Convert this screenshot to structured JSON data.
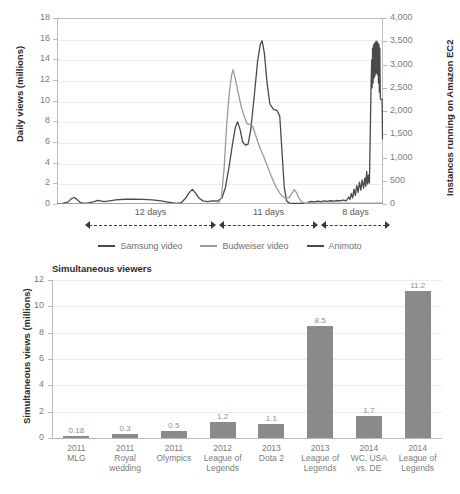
{
  "chart_data": [
    {
      "type": "line",
      "title": "",
      "xlabel": "",
      "ylabel": "Daily views (millions)",
      "y2label": "Instances running on Amazon EC2",
      "ylim": [
        0,
        18
      ],
      "y2lim": [
        0,
        4000
      ],
      "yticks": [
        "18",
        "16",
        "14",
        "12",
        "10",
        "8",
        "6",
        "4",
        "2",
        "0"
      ],
      "y2ticks": [
        "4,000",
        "3,500",
        "3,000",
        "2,500",
        "2,000",
        "1,500",
        "1,000",
        "500",
        "0"
      ],
      "grid": true,
      "legend_position": "bottom",
      "legend": [
        {
          "name": "Samsung video",
          "color": "#4a4a4a"
        },
        {
          "name": "Budweiser video",
          "color": "#9a9a9a"
        },
        {
          "name": "Animoto",
          "color": "#4a4a4a"
        }
      ],
      "annotations": [
        {
          "label": "12 days",
          "x_start": 85,
          "x_end": 216
        },
        {
          "label": "11 days",
          "x_start": 219,
          "x_end": 318
        },
        {
          "label": "8 days",
          "x_start": 321,
          "x_end": 390
        }
      ],
      "series": [
        {
          "name": "Samsung video",
          "color": "#4a4a4a",
          "axis": "left",
          "points": [
            [
              0.0,
              0.02
            ],
            [
              1.2,
              0.05
            ],
            [
              2.4,
              0.18
            ],
            [
              3.2,
              0.52
            ],
            [
              3.8,
              0.63
            ],
            [
              4.4,
              0.45
            ],
            [
              5.2,
              0.12
            ],
            [
              6.0,
              0.06
            ],
            [
              7.0,
              0.1
            ],
            [
              8.2,
              0.22
            ],
            [
              9.0,
              0.35
            ],
            [
              9.6,
              0.3
            ],
            [
              10.4,
              0.22
            ],
            [
              11.6,
              0.3
            ],
            [
              13.0,
              0.4
            ],
            [
              15.0,
              0.46
            ],
            [
              17.0,
              0.47
            ],
            [
              19.0,
              0.45
            ],
            [
              21.0,
              0.4
            ],
            [
              23.0,
              0.3
            ],
            [
              24.5,
              0.18
            ],
            [
              25.6,
              0.1
            ],
            [
              26.4,
              0.06
            ],
            [
              27.4,
              0.12
            ],
            [
              28.4,
              0.55
            ],
            [
              29.2,
              1.1
            ],
            [
              29.9,
              1.42
            ],
            [
              30.6,
              1.05
            ],
            [
              31.4,
              0.55
            ],
            [
              32.2,
              0.3
            ],
            [
              33.2,
              0.22
            ],
            [
              34.4,
              0.3
            ],
            [
              35.4,
              0.28
            ],
            [
              36.4,
              0.55
            ],
            [
              37.2,
              1.6
            ],
            [
              38.0,
              3.6
            ],
            [
              38.8,
              5.9
            ],
            [
              39.4,
              7.45
            ],
            [
              39.9,
              7.95
            ],
            [
              40.5,
              7.1
            ],
            [
              41.0,
              6.0
            ],
            [
              41.6,
              5.7
            ],
            [
              42.2,
              5.8
            ],
            [
              42.8,
              7.2
            ],
            [
              43.6,
              10.6
            ],
            [
              44.3,
              13.8
            ],
            [
              44.9,
              15.45
            ],
            [
              45.3,
              15.8
            ],
            [
              45.8,
              14.6
            ],
            [
              46.4,
              11.7
            ],
            [
              47.0,
              9.7
            ],
            [
              47.8,
              9.15
            ],
            [
              48.6,
              9.05
            ],
            [
              49.2,
              8.5
            ],
            [
              49.7,
              5.0
            ],
            [
              50.2,
              1.6
            ],
            [
              50.7,
              0.3
            ],
            [
              51.4,
              0.08
            ],
            [
              52.4,
              0.05
            ],
            [
              54.0,
              0.05
            ],
            [
              56.0,
              0.05
            ],
            [
              58.0,
              0.05
            ],
            [
              60.0,
              0.05
            ],
            [
              62.0,
              0.05
            ],
            [
              64.0,
              0.05
            ],
            [
              66.0,
              0.05
            ],
            [
              68.0,
              0.05
            ],
            [
              70.0,
              0.05
            ],
            [
              72.0,
              0.05
            ]
          ]
        },
        {
          "name": "Budweiser video",
          "color": "#9a9a9a",
          "axis": "left",
          "points": [
            [
              0.0,
              0.02
            ],
            [
              8.0,
              0.02
            ],
            [
              16.0,
              0.02
            ],
            [
              24.0,
              0.02
            ],
            [
              30.0,
              0.02
            ],
            [
              34.0,
              0.03
            ],
            [
              35.6,
              0.05
            ],
            [
              36.3,
              0.6
            ],
            [
              36.9,
              3.4
            ],
            [
              37.5,
              7.8
            ],
            [
              38.1,
              11.0
            ],
            [
              38.6,
              12.55
            ],
            [
              38.9,
              13.0
            ],
            [
              39.4,
              12.1
            ],
            [
              40.0,
              10.8
            ],
            [
              40.7,
              9.4
            ],
            [
              41.4,
              8.45
            ],
            [
              42.0,
              7.75
            ],
            [
              42.6,
              7.7
            ],
            [
              43.2,
              7.55
            ],
            [
              43.8,
              6.75
            ],
            [
              44.4,
              5.95
            ],
            [
              45.0,
              5.25
            ],
            [
              45.7,
              4.55
            ],
            [
              46.4,
              3.75
            ],
            [
              47.1,
              2.95
            ],
            [
              47.8,
              2.2
            ],
            [
              48.5,
              1.55
            ],
            [
              49.2,
              1.05
            ],
            [
              49.9,
              0.7
            ],
            [
              50.6,
              0.55
            ],
            [
              51.3,
              0.65
            ],
            [
              51.9,
              1.05
            ],
            [
              52.4,
              1.4
            ],
            [
              52.9,
              1.1
            ],
            [
              53.4,
              0.6
            ],
            [
              54.0,
              0.22
            ],
            [
              54.7,
              0.08
            ],
            [
              55.5,
              0.05
            ],
            [
              57.0,
              0.04
            ],
            [
              60.0,
              0.04
            ],
            [
              64.0,
              0.04
            ],
            [
              68.0,
              0.04
            ],
            [
              72.0,
              0.04
            ]
          ]
        },
        {
          "name": "Animoto",
          "color": "#4a4a4a",
          "axis": "right",
          "points": [
            [
              55.5,
              40
            ],
            [
              56.2,
              55
            ],
            [
              56.9,
              45
            ],
            [
              57.6,
              60
            ],
            [
              58.3,
              50
            ],
            [
              59.0,
              65
            ],
            [
              59.7,
              55
            ],
            [
              60.4,
              70
            ],
            [
              61.1,
              60
            ],
            [
              61.8,
              75
            ],
            [
              62.5,
              65
            ],
            [
              63.2,
              85
            ],
            [
              63.9,
              70
            ],
            [
              64.4,
              150
            ],
            [
              64.7,
              95
            ],
            [
              65.0,
              230
            ],
            [
              65.3,
              130
            ],
            [
              65.6,
              320
            ],
            [
              65.9,
              180
            ],
            [
              66.2,
              400
            ],
            [
              66.5,
              250
            ],
            [
              66.8,
              470
            ],
            [
              67.1,
              300
            ],
            [
              67.4,
              520
            ],
            [
              67.7,
              340
            ],
            [
              68.0,
              560
            ],
            [
              68.2,
              380
            ],
            [
              68.4,
              700
            ],
            [
              68.6,
              430
            ],
            [
              68.8,
              620
            ],
            [
              69.0,
              450
            ],
            [
              69.2,
              1600
            ],
            [
              69.35,
              2450
            ],
            [
              69.5,
              3100
            ],
            [
              69.6,
              2500
            ],
            [
              69.7,
              3350
            ],
            [
              69.8,
              2600
            ],
            [
              69.9,
              3420
            ],
            [
              70.0,
              2700
            ],
            [
              70.1,
              3450
            ],
            [
              70.2,
              2750
            ],
            [
              70.3,
              3480
            ],
            [
              70.4,
              2800
            ],
            [
              70.5,
              3500
            ],
            [
              70.6,
              2820
            ],
            [
              70.7,
              3490
            ],
            [
              70.8,
              2780
            ],
            [
              70.9,
              3460
            ],
            [
              71.0,
              2600
            ],
            [
              71.1,
              3430
            ],
            [
              71.2,
              2400
            ],
            [
              71.3,
              3350
            ],
            [
              71.4,
              2300
            ],
            [
              71.5,
              2250
            ],
            [
              71.6,
              2250
            ],
            [
              71.7,
              2250
            ],
            [
              71.8,
              2250
            ],
            [
              71.9,
              1400
            ]
          ]
        }
      ]
    },
    {
      "type": "bar",
      "title": "Simultaneous viewers",
      "xlabel": "",
      "ylabel": "Simultaneous views (millions)",
      "ylim": [
        0,
        12
      ],
      "yticks": [
        "12",
        "10",
        "8",
        "6",
        "4",
        "2",
        "0"
      ],
      "grid": true,
      "bar_color": "#8a8a8a",
      "categories": [
        "2011\nMLG",
        "2011\nRoyal\nwedding",
        "2011\nOlympics",
        "2012\nLeague of\nLegends",
        "2013\nDota 2",
        "2013\nLeague of\nLegends",
        "2014\nWC, USA\nvs. DE",
        "2014\nLeague of\nLegends"
      ],
      "category_lines": [
        [
          "2011",
          "MLG"
        ],
        [
          "2011",
          "Royal",
          "wedding"
        ],
        [
          "2011",
          "Olympics"
        ],
        [
          "2012",
          "League of",
          "Legends"
        ],
        [
          "2013",
          "Dota 2"
        ],
        [
          "2013",
          "League of",
          "Legends"
        ],
        [
          "2014",
          "WC, USA",
          "vs. DE"
        ],
        [
          "2014",
          "League of",
          "Legends"
        ]
      ],
      "values": [
        0.18,
        0.3,
        0.5,
        1.2,
        1.1,
        8.5,
        1.7,
        11.2
      ],
      "value_labels": [
        "0.18",
        "0.3",
        "0.5",
        "1.2",
        "1.1",
        "8.5",
        "1.7",
        "11.2"
      ]
    }
  ]
}
